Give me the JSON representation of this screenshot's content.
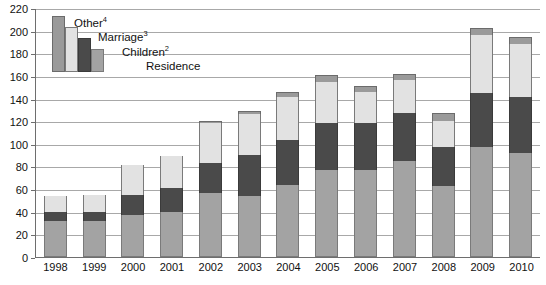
{
  "chart_data": {
    "type": "bar",
    "stacked": true,
    "title": "",
    "xlabel": "",
    "ylabel": "",
    "ylim": [
      0,
      220
    ],
    "ytick_step": 20,
    "yticks": [
      0,
      20,
      40,
      60,
      80,
      100,
      120,
      140,
      160,
      180,
      200,
      220
    ],
    "grid": true,
    "legend_position": "top-left",
    "categories": [
      "1998",
      "1999",
      "2000",
      "2001",
      "2002",
      "2003",
      "2004",
      "2005",
      "2006",
      "2007",
      "2008",
      "2009",
      "2010"
    ],
    "series": [
      {
        "name": "Residence",
        "label": "Residence",
        "color": "#a3a3a3",
        "values": [
          32,
          32,
          37,
          40,
          57,
          54,
          64,
          77,
          77,
          85,
          63,
          97,
          92
        ]
      },
      {
        "name": "Children",
        "label": "Children",
        "superscript": "2",
        "color": "#4a4a4a",
        "values": [
          8,
          8,
          18,
          21,
          26,
          36,
          39,
          41,
          41,
          42,
          34,
          48,
          49
        ]
      },
      {
        "name": "Marriage",
        "label": "Marriage",
        "superscript": "3",
        "color": "#e2e2e2",
        "values": [
          14,
          15,
          26,
          28,
          35,
          36,
          38,
          37,
          28,
          29,
          23,
          51,
          47
        ]
      },
      {
        "name": "Other",
        "label": "Other",
        "superscript": "4",
        "color": "#9a9a9a",
        "values": [
          0,
          0,
          0,
          0,
          2,
          3,
          5,
          6,
          5,
          6,
          7,
          6,
          6
        ]
      }
    ],
    "totals": [
      54,
      55,
      81,
      89,
      120,
      129,
      146,
      161,
      151,
      162,
      127,
      202,
      194
    ]
  },
  "legend": {
    "items": [
      {
        "label": "Other",
        "sup": "4"
      },
      {
        "label": "Marriage",
        "sup": "3"
      },
      {
        "label": "Children",
        "sup": "2"
      },
      {
        "label": "Residence",
        "sup": ""
      }
    ]
  }
}
